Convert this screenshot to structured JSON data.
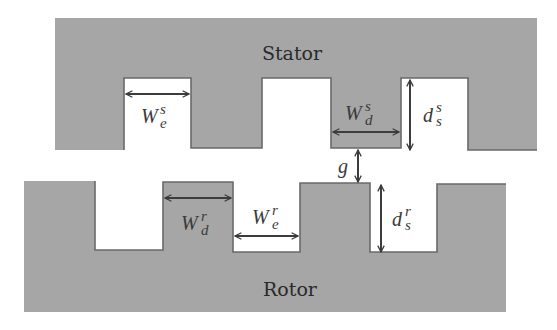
{
  "diagram": {
    "type": "stator-rotor tooth/slot geometry",
    "colors": {
      "iron": "#a6a6a6",
      "outline": "#6a6a6a",
      "background": "#ffffff",
      "arrow": "#3c3c3c",
      "text": "#2a2a2a"
    },
    "stator": {
      "label": "Stator",
      "teeth_count_visible": 4,
      "slots_count_visible": 3
    },
    "rotor": {
      "label": "Rotor",
      "teeth_count_visible": 4,
      "slots_count_visible": 3
    },
    "dimensions": {
      "stator_slot_width": {
        "base": "W",
        "sup": "s",
        "sub": "e"
      },
      "stator_tooth_width": {
        "base": "W",
        "sup": "s",
        "sub": "d"
      },
      "stator_slot_depth": {
        "base": "d",
        "sup": "s",
        "sub": "s"
      },
      "air_gap": {
        "base": "g"
      },
      "rotor_tooth_width": {
        "base": "W",
        "sup": "r",
        "sub": "d"
      },
      "rotor_slot_width": {
        "base": "W",
        "sup": "r",
        "sub": "e"
      },
      "rotor_slot_depth": {
        "base": "d",
        "sup": "r",
        "sub": "s"
      }
    }
  }
}
